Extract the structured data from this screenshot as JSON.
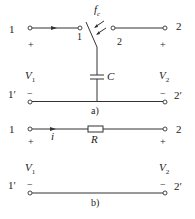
{
  "figure_a": {
    "caption": "a)",
    "port_left_top": "1",
    "port_left_bottom": "1′",
    "port_right_top": "2",
    "port_right_bottom": "2′",
    "switch_left_label": "1",
    "switch_right_label": "2",
    "switch_label_main": "f",
    "switch_label_sub": "c",
    "capacitor_label": "C",
    "v1_main": "V",
    "v1_sub": "1",
    "v2_main": "V",
    "v2_sub": "2",
    "plus": "+",
    "minus": "−"
  },
  "figure_b": {
    "caption": "b)",
    "port_left_top": "1",
    "port_left_bottom": "1′",
    "port_right_top": "2",
    "port_right_bottom": "2′",
    "current_label": "i",
    "resistor_label": "R",
    "v1_main": "V",
    "v1_sub": "1",
    "v2_main": "V",
    "v2_sub": "2",
    "plus": "+",
    "minus": "−"
  }
}
